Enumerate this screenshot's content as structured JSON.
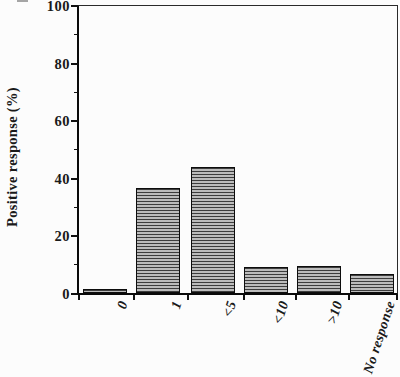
{
  "chart_data": {
    "type": "bar",
    "title": "",
    "xlabel": "",
    "ylabel": "Positive response (%)",
    "categories": [
      "0",
      "1",
      "<5",
      "<10",
      ">10",
      "No response"
    ],
    "values": [
      1.5,
      36.5,
      44,
      9,
      9.5,
      6.5
    ],
    "ylim": [
      0,
      100
    ],
    "y_major_ticks": [
      0,
      20,
      40,
      60,
      80,
      100
    ],
    "y_minor_ticks": [
      10,
      30,
      50,
      70,
      90
    ],
    "grid": false,
    "legend": false,
    "bar_fill_style": "horizontal-line-hatch",
    "colors": {
      "hatch_line": "#3d3d3d",
      "hatch_background": "#bcbcbc",
      "bar_border": "#0d0d0d",
      "axis": "#111111",
      "figure_background": "#fcfcfc"
    }
  }
}
